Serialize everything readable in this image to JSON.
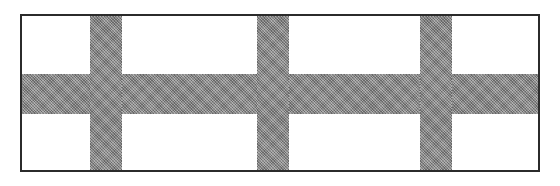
{
  "figure": {
    "canvas": {
      "width": 560,
      "height": 186,
      "background": "#ffffff"
    },
    "frame": {
      "x": 20,
      "y": 14,
      "width": 520,
      "height": 158,
      "border_width": 2,
      "border_color": "#2b2b2b",
      "fill": "#ffffff"
    },
    "band_color": "#8a8a8a",
    "cell_color": "#ffffff",
    "horizontal_bands": [
      {
        "name": "center-horizontal-band",
        "x": 0,
        "y": 58,
        "width": 520,
        "height": 40
      }
    ],
    "vertical_bands": [
      {
        "name": "vertical-band-1",
        "x": 68,
        "y": 0,
        "width": 32,
        "height": 158
      },
      {
        "name": "vertical-band-2",
        "x": 235,
        "y": 0,
        "width": 32,
        "height": 158
      },
      {
        "name": "vertical-band-3",
        "x": 398,
        "y": 0,
        "width": 32,
        "height": 158
      }
    ],
    "cells": [
      {
        "name": "cell-row1-col1",
        "row": 1,
        "col": 1,
        "x": 0,
        "y": 0,
        "width": 68,
        "height": 58
      },
      {
        "name": "cell-row1-col2",
        "row": 1,
        "col": 2,
        "x": 100,
        "y": 0,
        "width": 135,
        "height": 58
      },
      {
        "name": "cell-row1-col3",
        "row": 1,
        "col": 3,
        "x": 267,
        "y": 0,
        "width": 131,
        "height": 58
      },
      {
        "name": "cell-row1-col4",
        "row": 1,
        "col": 4,
        "x": 430,
        "y": 0,
        "width": 90,
        "height": 58
      },
      {
        "name": "cell-row2-col1",
        "row": 2,
        "col": 1,
        "x": 0,
        "y": 98,
        "width": 68,
        "height": 60
      },
      {
        "name": "cell-row2-col2",
        "row": 2,
        "col": 2,
        "x": 100,
        "y": 98,
        "width": 135,
        "height": 60
      },
      {
        "name": "cell-row2-col3",
        "row": 2,
        "col": 3,
        "x": 267,
        "y": 98,
        "width": 131,
        "height": 60
      },
      {
        "name": "cell-row2-col4",
        "row": 2,
        "col": 4,
        "x": 430,
        "y": 98,
        "width": 90,
        "height": 60
      }
    ],
    "counts": {
      "rows": 2,
      "columns": 4,
      "cell_total": 8,
      "horizontal_band_total": 1,
      "vertical_band_total": 3
    }
  }
}
